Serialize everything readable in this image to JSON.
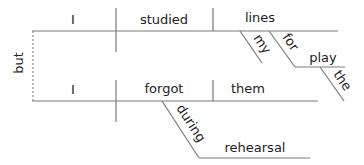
{
  "diagram": {
    "type": "sentence-diagram",
    "sentence": "I studied my lines for the play but I forgot them during rehearsal",
    "line_color": "#7a7a7a",
    "text_color": "#222222",
    "conjunction": "but",
    "clause1": {
      "subject": "I",
      "verb": "studied",
      "object": "lines",
      "object_modifier": "my",
      "preposition": "for",
      "prep_object": "play",
      "prep_object_modifier": "the"
    },
    "clause2": {
      "subject": "I",
      "verb": "forgot",
      "object": "them",
      "preposition": "during",
      "prep_object": "rehearsal"
    }
  }
}
